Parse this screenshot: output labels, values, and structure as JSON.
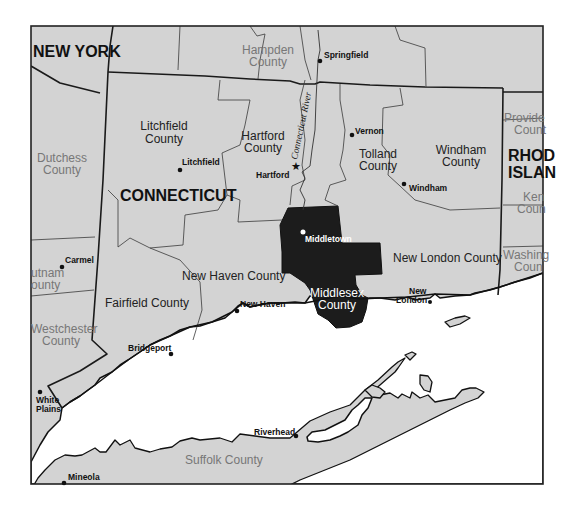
{
  "map": {
    "title": "Connecticut county map highlighting Middlesex County",
    "colors": {
      "land": "#d3d3d3",
      "water": "#ffffff",
      "highlight": "#1c1c1c",
      "border": "#1a1a1a"
    },
    "states": [
      {
        "name": "NEW YORK"
      },
      {
        "name": "CONNECTICUT"
      },
      {
        "name_line1": "RHODE",
        "name_line2": "ISLAND",
        "display_line1": "RHOD",
        "display_line2": "ISLAN"
      }
    ],
    "ct_counties": [
      {
        "line1": "Litchfield",
        "line2": "County"
      },
      {
        "line1": "Hartford",
        "line2": "County"
      },
      {
        "line1": "Tolland",
        "line2": "County"
      },
      {
        "line1": "Windham",
        "line2": "County"
      },
      {
        "line1": "New Haven County"
      },
      {
        "line1": "Fairfield County"
      },
      {
        "line1": "New London County"
      },
      {
        "line1": "Middlesex",
        "line2": "County",
        "highlighted": true
      }
    ],
    "other_counties": [
      {
        "line1": "Hampden",
        "line2": "County"
      },
      {
        "line1": "Dutchess",
        "line2": "County"
      },
      {
        "line1": "utnam",
        "line2": "ounty"
      },
      {
        "line1": "Westchester",
        "line2": "County"
      },
      {
        "line1": "Suffolk County"
      },
      {
        "line1": "Provide",
        "line2": "Count"
      },
      {
        "line1": "Ken",
        "line2": "Coun"
      },
      {
        "line1": "Washing",
        "line2": "Coun"
      }
    ],
    "cities": [
      {
        "name": "Springfield"
      },
      {
        "name": "Litchfield"
      },
      {
        "name": "Hartford",
        "capital": true
      },
      {
        "name": "Vernon"
      },
      {
        "name": "Windham"
      },
      {
        "name": "Middletown"
      },
      {
        "name": "Carmel"
      },
      {
        "name": "New Haven"
      },
      {
        "name_line1": "New",
        "name_line2": "London"
      },
      {
        "name": "Bridgeport"
      },
      {
        "name_line1": "White",
        "name_line2": "Plains"
      },
      {
        "name": "Riverhead"
      },
      {
        "name": "Mineola"
      }
    ],
    "river": {
      "name": "Connecticut River"
    }
  }
}
